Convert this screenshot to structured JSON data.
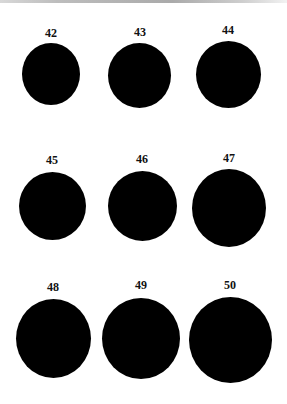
{
  "items": [
    {
      "label": "42",
      "color": "#000000"
    },
    {
      "label": "43",
      "color": "#000000"
    },
    {
      "label": "44",
      "color": "#000000"
    },
    {
      "label": "45",
      "color": "#000000"
    },
    {
      "label": "46",
      "color": "#000000"
    },
    {
      "label": "47",
      "color": "#000000"
    },
    {
      "label": "48",
      "color": "#000000"
    },
    {
      "label": "49",
      "color": "#000000"
    },
    {
      "label": "50",
      "color": "#000000"
    }
  ]
}
